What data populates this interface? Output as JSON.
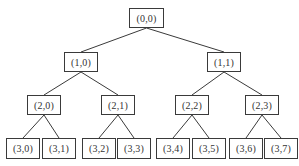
{
  "diagram": {
    "type": "binary-tree",
    "line_color": "#3a3a3a",
    "nodes": [
      {
        "id": "n00",
        "label": "(0,0)",
        "x": 129,
        "y": 8,
        "w": 35,
        "h": 20
      },
      {
        "id": "n10",
        "label": "(1,0)",
        "x": 64,
        "y": 52,
        "w": 34,
        "h": 20
      },
      {
        "id": "n11",
        "label": "(1,1)",
        "x": 207,
        "y": 52,
        "w": 34,
        "h": 20
      },
      {
        "id": "n20",
        "label": "(2,0)",
        "x": 27,
        "y": 95,
        "w": 34,
        "h": 20
      },
      {
        "id": "n21",
        "label": "(2,1)",
        "x": 101,
        "y": 95,
        "w": 34,
        "h": 20
      },
      {
        "id": "n22",
        "label": "(2,2)",
        "x": 175,
        "y": 95,
        "w": 34,
        "h": 20
      },
      {
        "id": "n23",
        "label": "(2,3)",
        "x": 245,
        "y": 95,
        "w": 34,
        "h": 20
      },
      {
        "id": "n30",
        "label": "(3,0)",
        "x": 6,
        "y": 138,
        "w": 34,
        "h": 21
      },
      {
        "id": "n31",
        "label": "(3,1)",
        "x": 42,
        "y": 138,
        "w": 34,
        "h": 21
      },
      {
        "id": "n32",
        "label": "(3,2)",
        "x": 82,
        "y": 138,
        "w": 34,
        "h": 21
      },
      {
        "id": "n33",
        "label": "(3,3)",
        "x": 117,
        "y": 138,
        "w": 34,
        "h": 21
      },
      {
        "id": "n34",
        "label": "(3,4)",
        "x": 156,
        "y": 138,
        "w": 34,
        "h": 21
      },
      {
        "id": "n35",
        "label": "(3,5)",
        "x": 192,
        "y": 138,
        "w": 34,
        "h": 21
      },
      {
        "id": "n36",
        "label": "(3,6)",
        "x": 229,
        "y": 138,
        "w": 34,
        "h": 21
      },
      {
        "id": "n37",
        "label": "(3,7)",
        "x": 264,
        "y": 138,
        "w": 34,
        "h": 21
      }
    ],
    "edges": [
      [
        "n00",
        "n10"
      ],
      [
        "n00",
        "n11"
      ],
      [
        "n10",
        "n20"
      ],
      [
        "n10",
        "n21"
      ],
      [
        "n11",
        "n22"
      ],
      [
        "n11",
        "n23"
      ],
      [
        "n20",
        "n30"
      ],
      [
        "n20",
        "n31"
      ],
      [
        "n21",
        "n32"
      ],
      [
        "n21",
        "n33"
      ],
      [
        "n22",
        "n34"
      ],
      [
        "n22",
        "n35"
      ],
      [
        "n23",
        "n36"
      ],
      [
        "n23",
        "n37"
      ]
    ]
  }
}
